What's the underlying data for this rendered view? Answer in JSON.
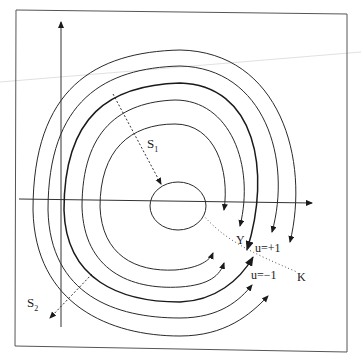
{
  "figure": {
    "labels": {
      "s1_main": "S",
      "s1_sub": "1",
      "s2_main": "S",
      "s2_sub": "2",
      "y": "Y",
      "u_plus": "u=+1",
      "u_minus": "u=−1",
      "k": "K"
    },
    "colors": {
      "ink": "#1a1a1a",
      "frame": "#555555",
      "background": "#ffffff"
    }
  }
}
